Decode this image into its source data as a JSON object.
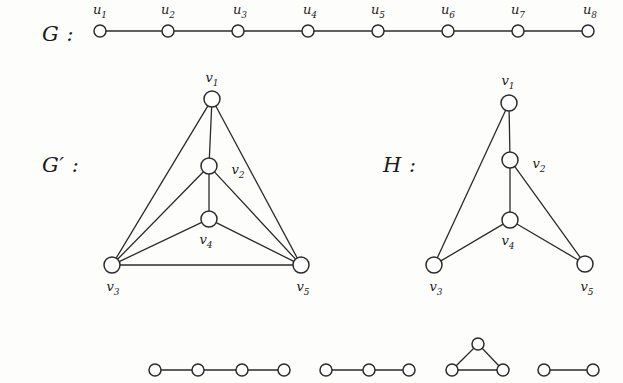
{
  "figure": {
    "type": "graph-diagram",
    "background_color": "#fdfdfc",
    "stroke_color": "#2b2b2b",
    "node_fill": "#ffffff"
  },
  "labels": {
    "g": "G :",
    "g_prime": "G′ :",
    "h": "H :"
  },
  "graphs": [
    {
      "id": "G",
      "name": "graph-g",
      "label": "G :",
      "label_pos": {
        "x": 42,
        "y": 22
      },
      "node_radius": 6,
      "vertices": [
        {
          "id": "u1",
          "label": "u",
          "sub": "1",
          "x": 100,
          "y": 31,
          "label_x": 100,
          "label_y": 11
        },
        {
          "id": "u2",
          "label": "u",
          "sub": "2",
          "x": 168,
          "y": 31,
          "label_x": 168,
          "label_y": 11
        },
        {
          "id": "u3",
          "label": "u",
          "sub": "3",
          "x": 238,
          "y": 31,
          "label_x": 240,
          "label_y": 11
        },
        {
          "id": "u4",
          "label": "u",
          "sub": "4",
          "x": 308,
          "y": 31,
          "label_x": 310,
          "label_y": 11
        },
        {
          "id": "u5",
          "label": "u",
          "sub": "5",
          "x": 378,
          "y": 31,
          "label_x": 378,
          "label_y": 11
        },
        {
          "id": "u6",
          "label": "u",
          "sub": "6",
          "x": 448,
          "y": 31,
          "label_x": 448,
          "label_y": 11
        },
        {
          "id": "u7",
          "label": "u",
          "sub": "7",
          "x": 518,
          "y": 31,
          "label_x": 518,
          "label_y": 11
        },
        {
          "id": "u8",
          "label": "u",
          "sub": "8",
          "x": 588,
          "y": 31,
          "label_x": 590,
          "label_y": 11
        }
      ],
      "edges": [
        [
          "u1",
          "u2"
        ],
        [
          "u2",
          "u3"
        ],
        [
          "u3",
          "u4"
        ],
        [
          "u4",
          "u5"
        ],
        [
          "u5",
          "u6"
        ],
        [
          "u6",
          "u7"
        ],
        [
          "u7",
          "u8"
        ]
      ]
    },
    {
      "id": "Gprime",
      "name": "graph-g-prime",
      "label": "G′ :",
      "label_pos": {
        "x": 42,
        "y": 153
      },
      "node_radius": 8,
      "vertices": [
        {
          "id": "v1",
          "label": "v",
          "sub": "1",
          "x": 212,
          "y": 99,
          "label_x": 212,
          "label_y": 79
        },
        {
          "id": "v2",
          "label": "v",
          "sub": "2",
          "x": 209,
          "y": 166,
          "label_x": 238,
          "label_y": 171
        },
        {
          "id": "v4",
          "label": "v",
          "sub": "4",
          "x": 209,
          "y": 219,
          "label_x": 206,
          "label_y": 241
        },
        {
          "id": "v3",
          "label": "v",
          "sub": "3",
          "x": 112,
          "y": 265,
          "label_x": 113,
          "label_y": 288
        },
        {
          "id": "v5",
          "label": "v",
          "sub": "5",
          "x": 301,
          "y": 265,
          "label_x": 303,
          "label_y": 288
        }
      ],
      "edges": [
        [
          "v1",
          "v2"
        ],
        [
          "v1",
          "v3"
        ],
        [
          "v1",
          "v5"
        ],
        [
          "v2",
          "v3"
        ],
        [
          "v2",
          "v4"
        ],
        [
          "v2",
          "v5"
        ],
        [
          "v4",
          "v3"
        ],
        [
          "v4",
          "v5"
        ],
        [
          "v3",
          "v5"
        ]
      ]
    },
    {
      "id": "H",
      "name": "graph-h",
      "label": "H :",
      "label_pos": {
        "x": 383,
        "y": 153
      },
      "node_radius": 8,
      "vertices": [
        {
          "id": "v1",
          "label": "v",
          "sub": "1",
          "x": 509,
          "y": 103,
          "label_x": 508,
          "label_y": 82
        },
        {
          "id": "v2",
          "label": "v",
          "sub": "2",
          "x": 510,
          "y": 160,
          "label_x": 539,
          "label_y": 165
        },
        {
          "id": "v4",
          "label": "v",
          "sub": "4",
          "x": 510,
          "y": 220,
          "label_x": 508,
          "label_y": 242
        },
        {
          "id": "v3",
          "label": "v",
          "sub": "3",
          "x": 434,
          "y": 265,
          "label_x": 436,
          "label_y": 288
        },
        {
          "id": "v5",
          "label": "v",
          "sub": "5",
          "x": 585,
          "y": 264,
          "label_x": 587,
          "label_y": 288
        }
      ],
      "edges": [
        [
          "v1",
          "v2"
        ],
        [
          "v1",
          "v3"
        ],
        [
          "v2",
          "v4"
        ],
        [
          "v2",
          "v5"
        ],
        [
          "v4",
          "v3"
        ],
        [
          "v4",
          "v5"
        ]
      ]
    }
  ],
  "bottom_row": {
    "name": "component-graphs-row",
    "node_radius": 6,
    "components": [
      {
        "id": "p4",
        "name": "path-4-vertices",
        "vertices": [
          {
            "id": "a1",
            "x": 155,
            "y": 370
          },
          {
            "id": "a2",
            "x": 198,
            "y": 370
          },
          {
            "id": "a3",
            "x": 242,
            "y": 370
          },
          {
            "id": "a4",
            "x": 284,
            "y": 370
          }
        ],
        "edges": [
          [
            "a1",
            "a2"
          ],
          [
            "a2",
            "a3"
          ],
          [
            "a3",
            "a4"
          ]
        ]
      },
      {
        "id": "p3",
        "name": "path-3-vertices",
        "vertices": [
          {
            "id": "b1",
            "x": 326,
            "y": 370
          },
          {
            "id": "b2",
            "x": 369,
            "y": 370
          },
          {
            "id": "b3",
            "x": 409,
            "y": 370
          }
        ],
        "edges": [
          [
            "b1",
            "b2"
          ],
          [
            "b2",
            "b3"
          ]
        ]
      },
      {
        "id": "k3",
        "name": "triangle-3-vertices",
        "vertices": [
          {
            "id": "c1",
            "x": 478,
            "y": 344
          },
          {
            "id": "c2",
            "x": 452,
            "y": 370
          },
          {
            "id": "c3",
            "x": 503,
            "y": 370
          }
        ],
        "edges": [
          [
            "c1",
            "c2"
          ],
          [
            "c1",
            "c3"
          ],
          [
            "c2",
            "c3"
          ]
        ]
      },
      {
        "id": "k2",
        "name": "edge-2-vertices",
        "vertices": [
          {
            "id": "d1",
            "x": 544,
            "y": 370
          },
          {
            "id": "d2",
            "x": 593,
            "y": 370
          }
        ],
        "edges": [
          [
            "d1",
            "d2"
          ]
        ]
      }
    ]
  }
}
